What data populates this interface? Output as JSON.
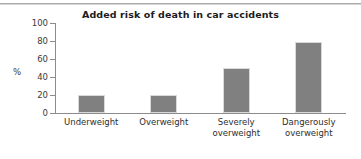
{
  "figure": {
    "background_color": "#ffffff",
    "rule_color": "#a9a9a9"
  },
  "chart_data": {
    "type": "bar",
    "title": "Added risk of death in car accidents",
    "xlabel": "",
    "ylabel": "%",
    "categories": [
      "Underweight",
      "Overweight",
      "Severely overweight",
      "Dangerously overweight"
    ],
    "category_lines": [
      [
        "Underweight"
      ],
      [
        "Overweight"
      ],
      [
        "Severely",
        "overweight"
      ],
      [
        "Dangerously",
        "overweight"
      ]
    ],
    "values": [
      20,
      20,
      50,
      79
    ],
    "ylim": [
      0,
      100
    ],
    "yticks": [
      0,
      20,
      40,
      60,
      80,
      100
    ],
    "ytick_labels": [
      "0",
      "20",
      "40",
      "60",
      "80",
      "100"
    ],
    "grid": false,
    "legend": null,
    "bar_color": "#808080",
    "axis_color": "#8c8c8c"
  }
}
